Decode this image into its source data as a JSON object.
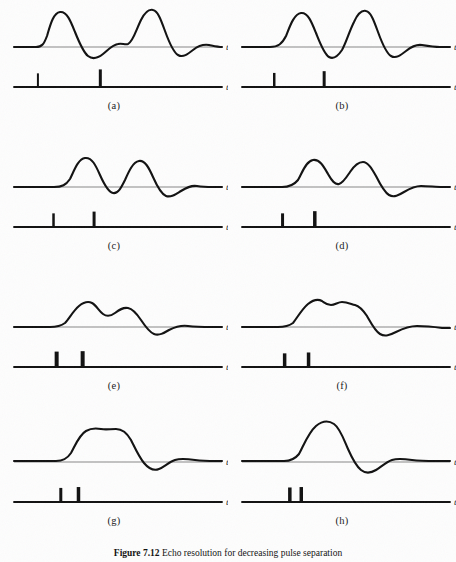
{
  "figure": {
    "caption_label": "Figure 7.12",
    "caption_text": "Echo resolution for decreasing pulse separation",
    "axis_label": "t",
    "stroke_color": "#111111",
    "baseline_color": "#555555",
    "background_color": "#fdfdfd"
  },
  "panels": [
    {
      "id": "a",
      "label": "(a)",
      "impulse_positions": [
        0.115,
        0.415
      ],
      "impulse_heights": [
        0.62,
        0.8
      ],
      "impulse_widths": [
        2.0,
        3.0
      ],
      "separation": 0.3,
      "resolution_state": "fully resolved",
      "waveform": "M 14,47 L 36,47 C 42,47 44,44 47,36 C 50,26 53,13 60,12 C 67,11 71,22 75,32 C 79,42 83,52 88,56 C 93,60 98,58 103,54 C 108,50 112,45 118,44 C 122,43 125,45 128,44 C 133,42 136,30 141,20 C 145,12 149,9 153,10 C 158,11 161,20 165,31 C 169,42 173,52 178,55 C 183,58 188,54 193,50 C 198,46 203,44 209,45 C 214,46 218,47 222,47"
    },
    {
      "id": "b",
      "label": "(b)",
      "impulse_positions": [
        0.155,
        0.395
      ],
      "impulse_heights": [
        0.64,
        0.72
      ],
      "impulse_widths": [
        2.5,
        3.0
      ],
      "separation": 0.24,
      "resolution_state": "resolved",
      "waveform": "M 14,47 L 42,47 C 50,47 54,44 58,36 C 62,26 66,14 73,13 C 80,12 84,23 88,33 C 92,43 96,54 101,57 C 106,60 110,56 114,50 C 118,43 121,32 126,22 C 130,13 134,10 138,11 C 143,12 146,21 150,32 C 154,43 158,53 163,56 C 168,59 173,55 178,51 C 183,47 188,44 194,45 C 200,46 206,47 212,47 C 216,47 219,47 222,47"
    },
    {
      "id": "c",
      "label": "(c)",
      "impulse_positions": [
        0.19,
        0.385
      ],
      "impulse_heights": [
        0.62,
        0.7
      ],
      "impulse_widths": [
        2.5,
        3.0
      ],
      "separation": 0.195,
      "resolution_state": "resolved, valley above baseline",
      "waveform": "M 14,47 L 54,47 C 62,47 66,45 70,39 C 74,31 78,19 85,18 C 92,17 96,26 100,35 C 104,44 108,52 113,53 C 118,54 121,48 125,40 C 129,31 133,22 139,21 C 145,20 149,28 153,37 C 157,46 161,54 166,56 C 171,58 176,54 181,51 C 186,48 191,45 197,46 C 203,47 208,47 213,47 C 217,47 220,47 222,47"
    },
    {
      "id": "d",
      "label": "(d)",
      "impulse_positions": [
        0.195,
        0.35
      ],
      "impulse_heights": [
        0.62,
        0.72
      ],
      "impulse_widths": [
        3.0,
        3.5
      ],
      "separation": 0.155,
      "resolution_state": "marginally resolved",
      "waveform": "M 14,47 L 54,47 C 62,47 66,45 70,40 C 74,33 78,21 85,20 C 92,19 96,27 100,34 C 104,41 107,45 111,44 C 115,43 118,38 122,32 C 126,26 130,22 135,22 C 140,22 144,29 148,36 C 152,44 156,52 161,55 C 166,58 171,55 176,52 C 181,49 187,46 193,46 C 200,46 208,47 214,47 C 218,47 220,47 222,47"
    },
    {
      "id": "e",
      "label": "(e)",
      "impulse_positions": [
        0.205,
        0.33
      ],
      "impulse_heights": [
        0.7,
        0.72
      ],
      "impulse_widths": [
        4.0,
        4.0
      ],
      "separation": 0.125,
      "resolution_state": "barely resolved, shallow dip",
      "waveform": "M 14,47 L 50,47 C 57,47 61,46 65,43 C 69,39 73,31 79,26 C 84,22 88,21 92,23 C 96,25 99,31 103,34 C 107,37 111,36 115,33 C 119,30 123,27 128,28 C 133,29 137,34 141,40 C 145,46 149,52 154,54 C 159,56 164,53 169,50 C 175,47 181,45 188,46 C 196,47 205,47 212,47 C 217,47 220,47 222,47"
    },
    {
      "id": "f",
      "label": "(f)",
      "impulse_positions": [
        0.205,
        0.32
      ],
      "impulse_heights": [
        0.62,
        0.66
      ],
      "impulse_widths": [
        3.5,
        3.5
      ],
      "separation": 0.115,
      "resolution_state": "unresolved, flat top with ripple",
      "waveform": "M 14,47 L 50,47 C 57,47 61,46 65,43 C 69,38 74,29 80,24 C 85,20 90,19 94,21 C 97,23 99,25 103,25 C 107,25 110,22 114,22 C 119,22 123,24 127,25 C 131,26 135,30 139,36 C 143,43 147,51 152,54 C 157,57 162,55 168,52 C 174,49 181,46 189,46 C 198,46 207,47 214,48 C 218,48 220,48 222,48"
    },
    {
      "id": "g",
      "label": "(g)",
      "impulse_positions": [
        0.225,
        0.31
      ],
      "impulse_heights": [
        0.64,
        0.68
      ],
      "impulse_widths": [
        3.0,
        3.5
      ],
      "separation": 0.085,
      "resolution_state": "unresolved, single plateau",
      "waveform": "M 14,46 L 56,46 C 63,46 67,44 71,38 C 75,31 79,20 86,16 C 91,13 96,13 101,14 C 106,15 110,14 116,14 C 122,14 127,18 131,25 C 135,33 139,42 144,48 C 149,54 154,56 159,54 C 164,52 169,47 175,45 C 181,43 188,44 195,45 C 203,46 210,46 216,46 C 219,46 221,46 222,46"
    },
    {
      "id": "h",
      "label": "(h)",
      "impulse_positions": [
        0.23,
        0.285
      ],
      "impulse_heights": [
        0.66,
        0.68
      ],
      "impulse_widths": [
        3.5,
        3.5
      ],
      "separation": 0.055,
      "resolution_state": "fully merged, single peak",
      "waveform": "M 14,46 L 56,46 C 63,46 67,44 71,39 C 75,32 80,18 88,11 C 94,6 100,5 106,9 C 112,13 116,25 120,34 C 124,43 128,51 133,55 C 138,59 143,58 148,55 C 153,52 158,47 164,45 C 170,43 177,44 184,45 C 192,46 200,46 208,46 C 214,46 219,46 222,46"
    }
  ]
}
